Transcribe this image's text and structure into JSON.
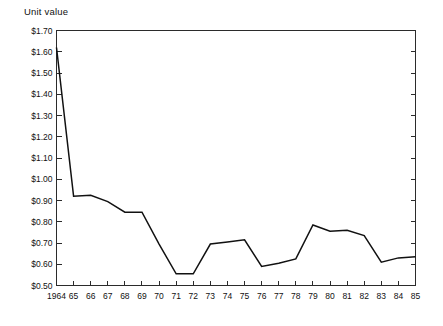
{
  "chart_title": "Unit value",
  "chart_data": {
    "type": "line",
    "title": "Unit value",
    "subtitle": "",
    "xlabel": "",
    "ylabel": "",
    "grid": false,
    "legend": null,
    "legend_position": "none",
    "x": [
      1964,
      1965,
      1966,
      1967,
      1968,
      1969,
      1970,
      1971,
      1972,
      1973,
      1974,
      1975,
      1976,
      1977,
      1978,
      1979,
      1980,
      1981,
      1982,
      1983,
      1984,
      1985
    ],
    "categories": [
      "1964",
      "65",
      "66",
      "67",
      "68",
      "69",
      "70",
      "71",
      "72",
      "73",
      "74",
      "75",
      "76",
      "77",
      "78",
      "79",
      "80",
      "81",
      "82",
      "83",
      "84",
      "85"
    ],
    "values": [
      1.62,
      0.92,
      0.925,
      0.895,
      0.845,
      0.845,
      0.695,
      0.555,
      0.555,
      0.695,
      0.705,
      0.715,
      0.59,
      0.605,
      0.625,
      0.785,
      0.755,
      0.76,
      0.735,
      0.61,
      0.63,
      0.635
    ],
    "xlim": [
      1964,
      1985
    ],
    "ylim": [
      0.5,
      1.7
    ],
    "ytick_values": [
      1.7,
      1.6,
      1.5,
      1.4,
      1.3,
      1.2,
      1.1,
      1.0,
      0.9,
      0.8,
      0.7,
      0.6,
      0.5
    ],
    "ytick_labels": [
      "$1.70",
      "$1.60",
      "$1.50",
      "$1.40",
      "$1.30",
      "$1.20",
      "$1.10",
      "$1.00",
      "$0.90",
      "$0.80",
      "$0.70",
      "$0.60",
      "$0.50"
    ],
    "xtick_labels": [
      "1964",
      "65",
      "66",
      "67",
      "68",
      "69",
      "70",
      "71",
      "72",
      "73",
      "74",
      "75",
      "76",
      "77",
      "78",
      "79",
      "80",
      "81",
      "82",
      "83",
      "84",
      "85"
    ],
    "line_color": "#111111",
    "axis_color": "#2b2b2b",
    "background_color": "#ffffff"
  }
}
